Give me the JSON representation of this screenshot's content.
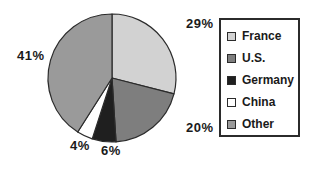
{
  "chart_data": {
    "type": "pie",
    "title": "",
    "labels": [
      "France",
      "U.S.",
      "Germany",
      "China",
      "Other"
    ],
    "values": [
      29,
      20,
      6,
      4,
      41
    ],
    "value_labels": [
      "29%",
      "20%",
      "6%",
      "4%",
      "41%"
    ],
    "unit": "%",
    "start_angle_deg": 0,
    "direction": "clockwise",
    "legend_position": "right",
    "grid": false,
    "colors": [
      "#d2d2d2",
      "#7e7e7e",
      "#1f1f1f",
      "#ffffff",
      "#9a9a9a"
    ],
    "outline_color": "#2b2b2b",
    "slices": [
      {
        "label": "France",
        "value": 29,
        "display": "29%",
        "color": "#d2d2d2"
      },
      {
        "label": "U.S.",
        "value": 20,
        "display": "20%",
        "color": "#7e7e7e"
      },
      {
        "label": "Germany",
        "value": 6,
        "display": "6%",
        "color": "#1f1f1f"
      },
      {
        "label": "China",
        "value": 4,
        "display": "4%",
        "color": "#ffffff"
      },
      {
        "label": "Other",
        "value": 41,
        "display": "41%",
        "color": "#9a9a9a"
      }
    ]
  },
  "labels": {
    "france": "29%",
    "us": "20%",
    "germany": "6%",
    "china": "4%",
    "other": "41%"
  },
  "legend": {
    "items": [
      {
        "label": "France"
      },
      {
        "label": "U.S."
      },
      {
        "label": "Germany"
      },
      {
        "label": "China"
      },
      {
        "label": "Other"
      }
    ]
  }
}
